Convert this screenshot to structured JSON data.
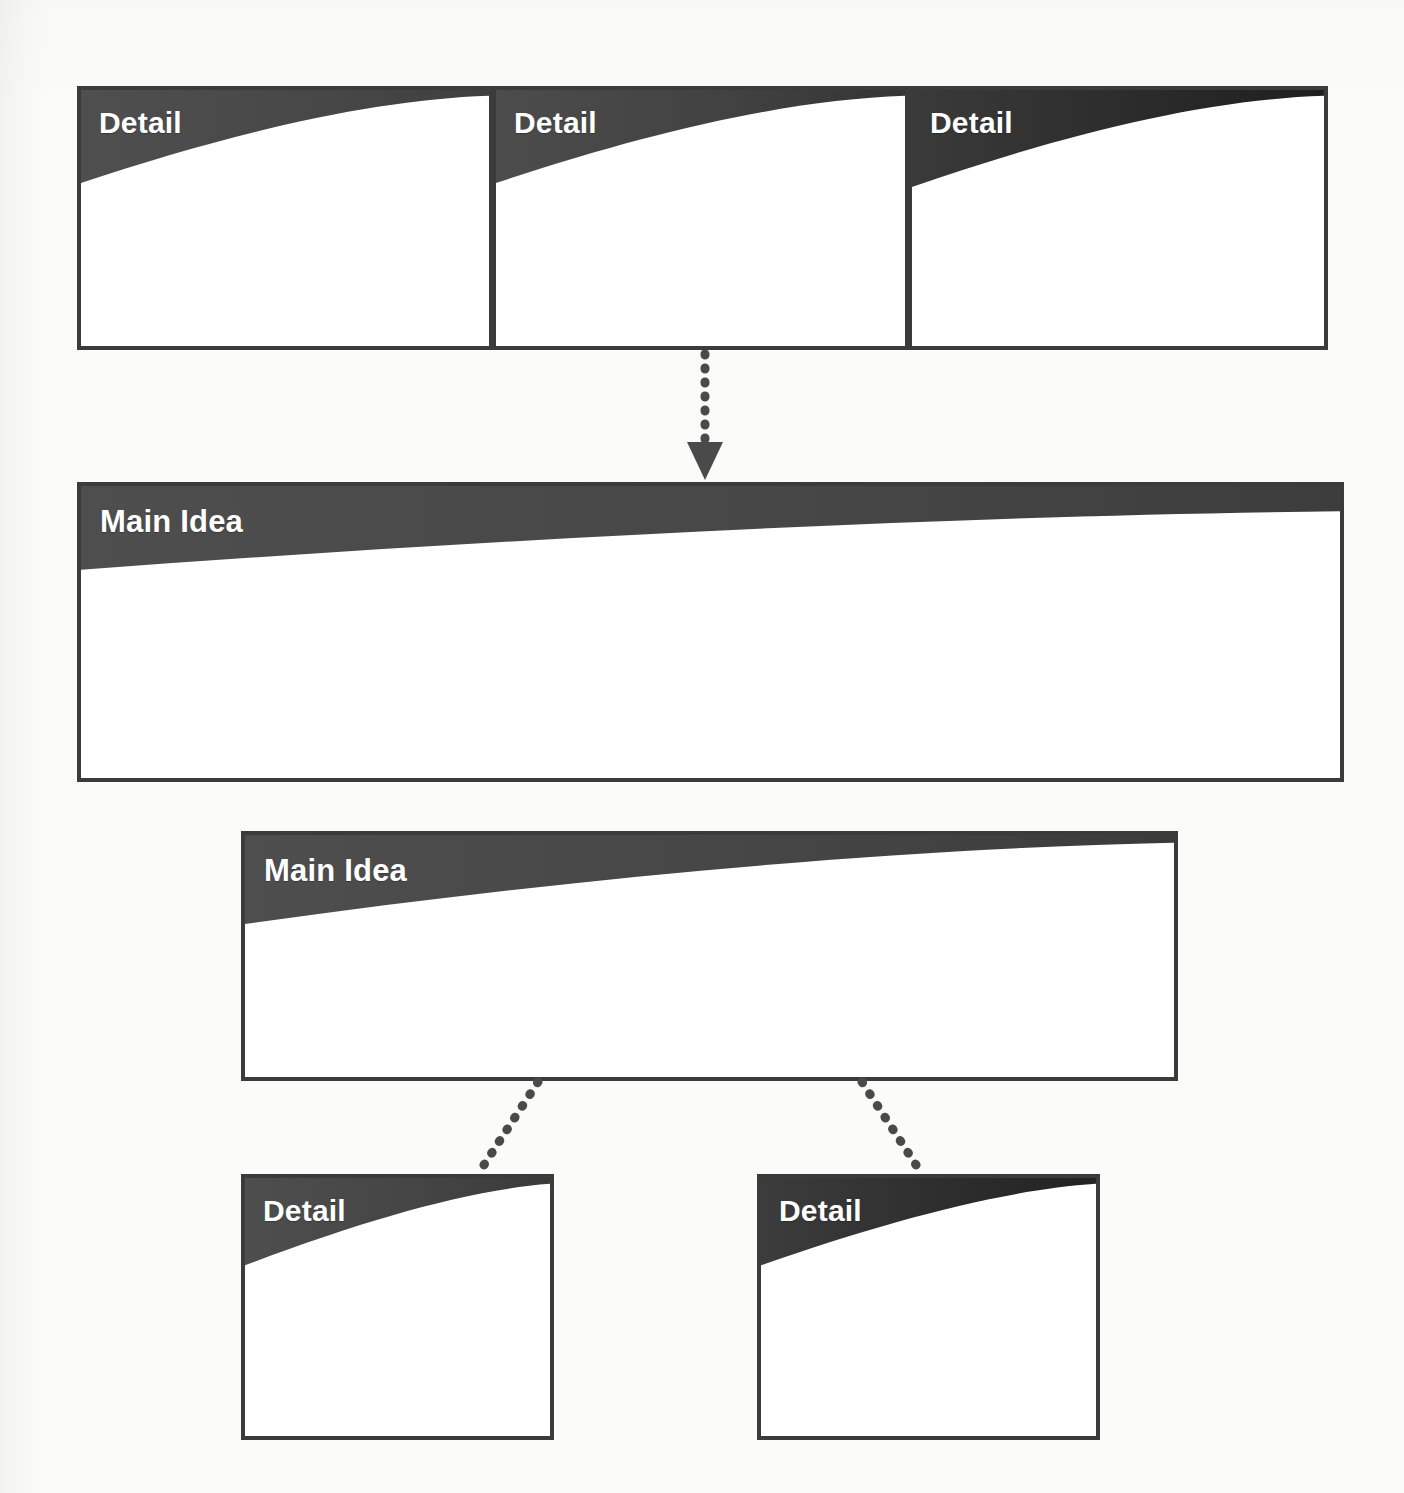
{
  "document": {
    "title": "Main Idea and Details Graphic Organizer",
    "background_color": "#fbfbfa"
  },
  "theme": {
    "border_color": "#3b3b3b",
    "banner_gray": "#4a4a4a",
    "banner_gray_dark": "#3a3a3a",
    "banner_black": "#262626",
    "label_color": "#ffffff",
    "connector_color": "#4a4a4a",
    "box_fill": "#ffffff"
  },
  "organizer": {
    "top_details": [
      {
        "label": "Detail",
        "tone": "gray"
      },
      {
        "label": "Detail",
        "tone": "gray"
      },
      {
        "label": "Detail",
        "tone": "black"
      }
    ],
    "main_idea_primary": {
      "label": "Main Idea"
    },
    "main_idea_secondary": {
      "label": "Main Idea"
    },
    "bottom_details": [
      {
        "label": "Detail",
        "tone": "gray"
      },
      {
        "label": "Detail",
        "tone": "black"
      }
    ]
  },
  "connectors": {
    "top_to_main": {
      "style": "dotted",
      "arrowhead": "triangle-down"
    },
    "main_to_left_detail": {
      "style": "dotted",
      "arrowhead": "none"
    },
    "main_to_right_detail": {
      "style": "dotted",
      "arrowhead": "none"
    }
  }
}
